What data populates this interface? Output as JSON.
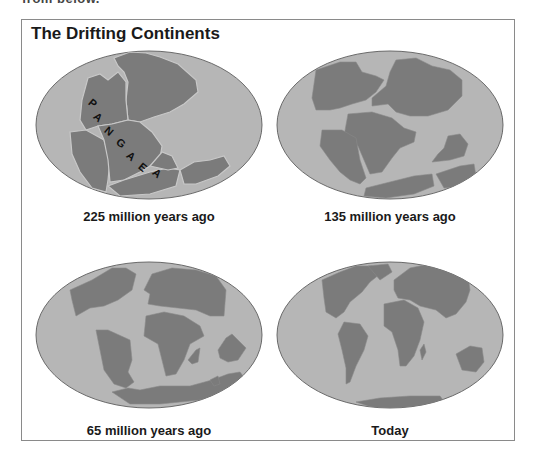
{
  "clipped_text": "from below.",
  "title": "The Drifting Continents",
  "colors": {
    "ocean": "#b6b6b6",
    "land": "#7b7b7b",
    "coast": "#c8c8c8",
    "outline": "#6a6a6a",
    "frame": "#8a8a8a",
    "text": "#1a1a1a"
  },
  "maps": [
    {
      "caption": "225 million years ago",
      "label": "PANGAEA",
      "letters": [
        "P",
        "A",
        "N",
        "G",
        "A",
        "E",
        "A"
      ]
    },
    {
      "caption": "135 million years ago"
    },
    {
      "caption": "65 million years ago"
    },
    {
      "caption": "Today"
    }
  ]
}
